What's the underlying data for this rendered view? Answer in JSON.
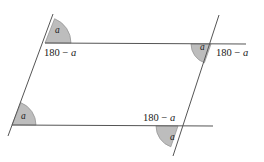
{
  "figure": {
    "background_color": "#ffffff",
    "line_color": "#555555",
    "wedge_fill_color": "#bdbdbd",
    "wedge_stroke_color": "#8f8f8f",
    "text_color": "#1a1a1a"
  },
  "labels": {
    "angle_a": "a",
    "supplement": "180 − a",
    "supplement_number": "180",
    "supplement_dash": " − ",
    "supplement_var": "a"
  },
  "vertices": {
    "top_left": {
      "x": 45,
      "y": 43
    },
    "top_right": {
      "x": 211,
      "y": 44
    },
    "bottom_left": {
      "x": 12,
      "y": 125
    },
    "bottom_right": {
      "x": 178,
      "y": 126
    }
  },
  "lines": [
    {
      "name": "top-parallel-line",
      "x1": 45,
      "y1": 43,
      "x2": 246,
      "y2": 44
    },
    {
      "name": "bottom-parallel-line",
      "x1": 12,
      "y1": 125,
      "x2": 213,
      "y2": 126
    },
    {
      "name": "left-transversal",
      "x1": 53,
      "y1": 14,
      "x2": 8,
      "y2": 136
    },
    {
      "name": "right-transversal",
      "x1": 219,
      "y1": 15,
      "x2": 173,
      "y2": 156
    }
  ],
  "angles": [
    {
      "name": "top-left-angle-a",
      "vertex": "top_left",
      "label": "a",
      "label_x": 57,
      "label_y": 29,
      "radius": 26
    },
    {
      "name": "top-right-angle-a",
      "vertex": "top_right",
      "label": "a",
      "label_x": 201,
      "label_y": 47,
      "radius": 20
    },
    {
      "name": "bottom-left-angle-a",
      "vertex": "bottom_left",
      "label": "a",
      "label_x": 22,
      "label_y": 116,
      "radius": 24
    },
    {
      "name": "bottom-right-angle-a",
      "vertex": "bottom_right",
      "label": "a",
      "label_x": 171,
      "label_y": 139,
      "radius": 22
    }
  ],
  "supplements": [
    {
      "name": "top-left-supplement",
      "text": "180 − a",
      "x": 44,
      "y": 47
    },
    {
      "name": "top-right-supplement",
      "text": "180 − a",
      "x": 216,
      "y": 47
    },
    {
      "name": "bottom-right-supplement",
      "text": "180 − a",
      "x": 143,
      "y": 112
    }
  ]
}
